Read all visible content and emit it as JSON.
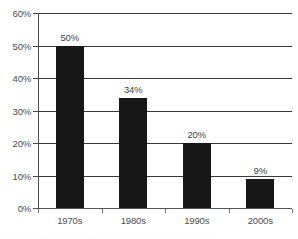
{
  "chart_data": {
    "type": "bar",
    "title": "",
    "xlabel": "",
    "ylabel": "",
    "categories": [
      "1970s",
      "1980s",
      "1990s",
      "2000s"
    ],
    "values": [
      50,
      34,
      20,
      9
    ],
    "value_labels": [
      "50%",
      "34%",
      "20%",
      "9%"
    ],
    "ylim": [
      0,
      60
    ],
    "ytick_values": [
      60,
      50,
      40,
      30,
      20,
      10,
      0
    ],
    "ytick_labels": [
      "60%",
      "50%",
      "40%",
      "30%",
      "20%",
      "10%",
      "0%"
    ],
    "grid": true,
    "legend": false,
    "legend_position": "none",
    "bar_color": "#171717",
    "grid_color": "#3a3a3a",
    "axis_color": "#4a4a4a",
    "text_color": "#4d4d4d",
    "background": "#ffffff"
  },
  "footer": {
    "clipped_caption": "……  …… ……… …  ……  ……  ……  …… ……"
  }
}
